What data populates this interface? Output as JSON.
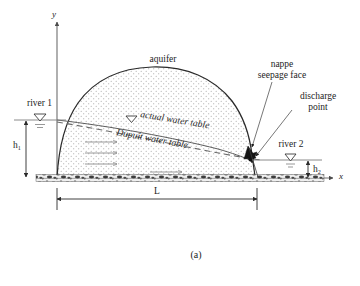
{
  "figure": {
    "caption": "(a)",
    "title_description": "Unconfined aquifer between two rivers with actual and Dupuit water tables"
  },
  "axes": {
    "y_label": "y",
    "x_label": "x",
    "origin_x": 57,
    "origin_y": 178
  },
  "labels": {
    "aquifer": "aquifer",
    "actual_water_table": "actual water table",
    "dupuit_water_table": "Dupuit water table",
    "nappe": "nappe",
    "seepage_face": "seepage face",
    "discharge": "discharge",
    "point": "point",
    "river_1": "river 1",
    "river_2": "river 2"
  },
  "dimensions": [
    {
      "name": "h1",
      "symbol": "h",
      "subscript": "1",
      "orientation": "vertical",
      "side": "left"
    },
    {
      "name": "h2",
      "symbol": "h",
      "subscript": "2",
      "orientation": "vertical",
      "side": "right"
    },
    {
      "name": "L",
      "symbol": "L",
      "subscript": "",
      "orientation": "horizontal",
      "side": "bottom"
    }
  ],
  "colors": {
    "line": "#2a2a2a",
    "axis": "#6e6e6e",
    "water_table_actual": "#5d5d5d",
    "water_table_dupuit": "#6a6a6a",
    "flow_arrow": "#8d8d8d",
    "seepage_face": "#141414",
    "background": "#ffffff",
    "stipple": "#9a9a9a"
  },
  "flow_arrows": {
    "count": 3,
    "direction": "left-to-right"
  }
}
